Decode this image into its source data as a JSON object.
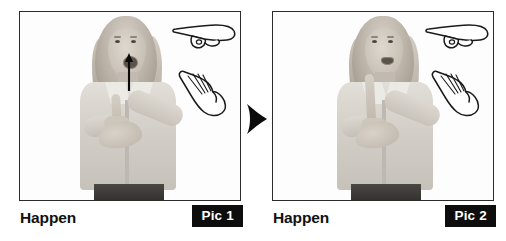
{
  "page": {
    "background_color": "#ffffff",
    "layout": "two-panel sign-language sequence, left to right",
    "separator_icon": "right-arrow-icon"
  },
  "colors": {
    "frame_border": "#2b2b2b",
    "badge_background": "#0d0d0d",
    "badge_text": "#ffffff",
    "caption_text": "#111111",
    "photo_background": "#fdfdfd",
    "line_art": "#1a1a1a"
  },
  "panels": [
    {
      "caption": "Happen",
      "badge": "Pic 1",
      "photo_description": "Grayscale photo of a woman signing: mouth open, right index finger pointing upward supported by left flat hand at chest height",
      "motion_arrow": "up-arrow-icon",
      "has_motion_arrow": true,
      "handshape_icons": [
        {
          "name": "pointing-hand-icon",
          "description": "index finger pointing horizontally"
        },
        {
          "name": "flat-palm-hand-icon",
          "description": "open flat palm, fingers extended"
        }
      ]
    },
    {
      "caption": "Happen",
      "badge": "Pic 2",
      "photo_description": "Grayscale photo of the same woman, index finger now raised fully upright, mouth closed, left hand supporting below",
      "motion_arrow": "",
      "has_motion_arrow": false,
      "handshape_icons": [
        {
          "name": "pointing-hand-icon",
          "description": "index finger pointing horizontally"
        },
        {
          "name": "flat-palm-hand-icon",
          "description": "open flat palm, fingers extended"
        }
      ]
    }
  ]
}
